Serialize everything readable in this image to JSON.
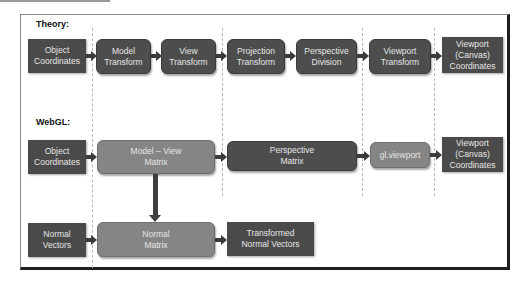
{
  "theory": {
    "label": "Theory:",
    "boxes": [
      {
        "text": "Object\nCoordinates"
      },
      {
        "text": "Model\nTransform"
      },
      {
        "text": "View\nTransform"
      },
      {
        "text": "Projection\nTransform"
      },
      {
        "text": "Perspective\nDivision"
      },
      {
        "text": "Viewport\nTransform"
      },
      {
        "text": "Viewport\n(Canvas)\nCoordinates"
      }
    ]
  },
  "webgl": {
    "label": "WebGL:",
    "boxes": [
      {
        "text": "Object\nCoordinates"
      },
      {
        "text": "Model – View\nMatrix"
      },
      {
        "text": "Perspective\nMatrix"
      },
      {
        "text": "gl.viewport"
      },
      {
        "text": "Viewport\n(Canvas)\nCoordinates"
      }
    ],
    "normals": [
      {
        "text": "Normal\nVectors"
      },
      {
        "text": "Normal\nMatrix"
      },
      {
        "text": "Transformed\nNormal Vectors"
      }
    ]
  },
  "colors": {
    "dark_box": "#4a4a4a",
    "light_box": "#858585",
    "frame_shadow": "#1e1e1e"
  }
}
